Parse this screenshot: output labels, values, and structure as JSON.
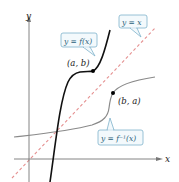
{
  "diagram": {
    "axes": {
      "x_label": "x",
      "y_label": "y"
    },
    "curves": [
      {
        "name": "f",
        "label": "y = f(x)",
        "color": "#1a1a1a"
      },
      {
        "name": "f_inverse",
        "label": "y = f⁻¹(x)",
        "color": "#888888"
      },
      {
        "name": "identity",
        "label": "y = x",
        "color": "#e07a7a",
        "style": "dashed"
      }
    ],
    "points": [
      {
        "name": "point-a-b",
        "label": "(a, b)"
      },
      {
        "name": "point-b-a",
        "label": "(b, a)"
      }
    ],
    "callout_box": {
      "border_color": "#7fb3cc",
      "fill_color": "#f3f9fc"
    }
  }
}
